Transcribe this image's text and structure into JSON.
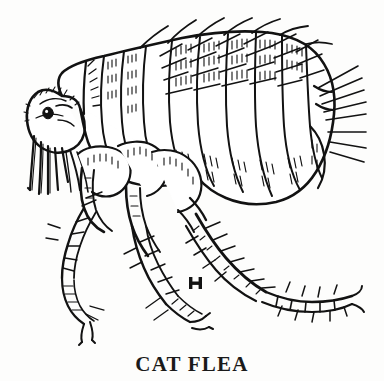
{
  "figure": {
    "caption": "CAT FLEA",
    "subject": "cat flea",
    "view": "lateral, facing left",
    "style": "black and white scientific line drawing / engraving",
    "ink_color": "#121212",
    "background_color": "#fdfdfc",
    "scale_bar": {
      "name": "scale-bar",
      "shape": "I-beam",
      "label": "",
      "x": 189,
      "y": 277,
      "width": 13,
      "height": 12
    },
    "parts": [
      {
        "name": "head",
        "label": "head"
      },
      {
        "name": "eye",
        "label": "eye"
      },
      {
        "name": "genal-comb",
        "label": "genal comb"
      },
      {
        "name": "mouthparts",
        "label": "mouthparts"
      },
      {
        "name": "antenna",
        "label": "antenna"
      },
      {
        "name": "pronotal-comb",
        "label": "pronotal comb"
      },
      {
        "name": "thorax",
        "label": "thorax"
      },
      {
        "name": "abdomen",
        "label": "abdomen"
      },
      {
        "name": "abdominal-segments",
        "label": "abdominal segments"
      },
      {
        "name": "dorsal-bristles",
        "label": "dorsal bristles"
      },
      {
        "name": "posterior-bristles",
        "label": "posterior bristles"
      },
      {
        "name": "foreleg",
        "label": "foreleg"
      },
      {
        "name": "middle-leg",
        "label": "middle leg"
      },
      {
        "name": "hind-leg",
        "label": "hind leg"
      },
      {
        "name": "tarsal-claws",
        "label": "tarsal claws"
      }
    ]
  }
}
